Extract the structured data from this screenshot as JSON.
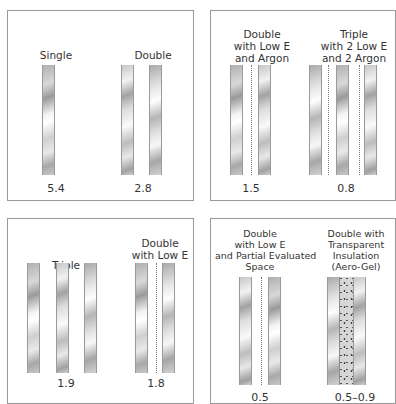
{
  "figure": {
    "panels": [
      {
        "configs": [
          {
            "label": "Single",
            "value": "5.4"
          },
          {
            "label": "Double",
            "value": "2.8"
          }
        ]
      },
      {
        "configs": [
          {
            "label": "Double\nwith Low E\nand Argon",
            "label_lines": [
              "Double",
              "with Low E",
              "and Argon"
            ],
            "value": "1.5"
          },
          {
            "label": "Triple\nwith 2 Low E\nand 2 Argon",
            "label_lines": [
              "Triple",
              "with 2 Low E",
              "and 2 Argon"
            ],
            "value": "0.8"
          }
        ]
      },
      {
        "configs": [
          {
            "label": "Triple",
            "value": "1.9"
          },
          {
            "label": "Double\nwith Low E",
            "label_lines": [
              "Double",
              "with Low E"
            ],
            "value": "1.8"
          }
        ]
      },
      {
        "configs": [
          {
            "label": "Double\nwith Low E\nand Partial Evaluated\nSpace",
            "label_lines": [
              "Double",
              "with Low E",
              "and Partial Evaluated",
              "Space"
            ],
            "value": "0.5"
          },
          {
            "label": "Double with\nTransparent\nInsulation\n(Aero-Gel)",
            "label_lines": [
              "Double with",
              "Transparent",
              "Insulation",
              "(Aero-Gel)"
            ],
            "value": "0.5–0.9"
          }
        ]
      }
    ]
  },
  "colors": {
    "border": "#9a9a9a",
    "text": "#333333",
    "glass_dark": "#9a9a9a",
    "glass_light": "#ffffff"
  }
}
